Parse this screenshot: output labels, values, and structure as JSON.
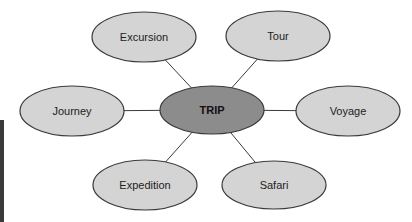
{
  "diagram": {
    "type": "concept-map",
    "center": {
      "label": "TRIP",
      "cx": 212,
      "cy": 110,
      "rx": 52,
      "ry": 24,
      "fill": "#8c8c8c"
    },
    "nodes": [
      {
        "label": "Excursion",
        "cx": 144,
        "cy": 37,
        "rx": 52,
        "ry": 25
      },
      {
        "label": "Tour",
        "cx": 278,
        "cy": 36,
        "rx": 52,
        "ry": 25
      },
      {
        "label": "Journey",
        "cx": 72,
        "cy": 111,
        "rx": 52,
        "ry": 25
      },
      {
        "label": "Voyage",
        "cx": 348,
        "cy": 111,
        "rx": 52,
        "ry": 25
      },
      {
        "label": "Expedition",
        "cx": 145,
        "cy": 185,
        "rx": 52,
        "ry": 25
      },
      {
        "label": "Safari",
        "cx": 274,
        "cy": 185,
        "rx": 52,
        "ry": 24
      }
    ],
    "node_fill": "#d4d4d4",
    "stroke": "#3a3a3a"
  }
}
